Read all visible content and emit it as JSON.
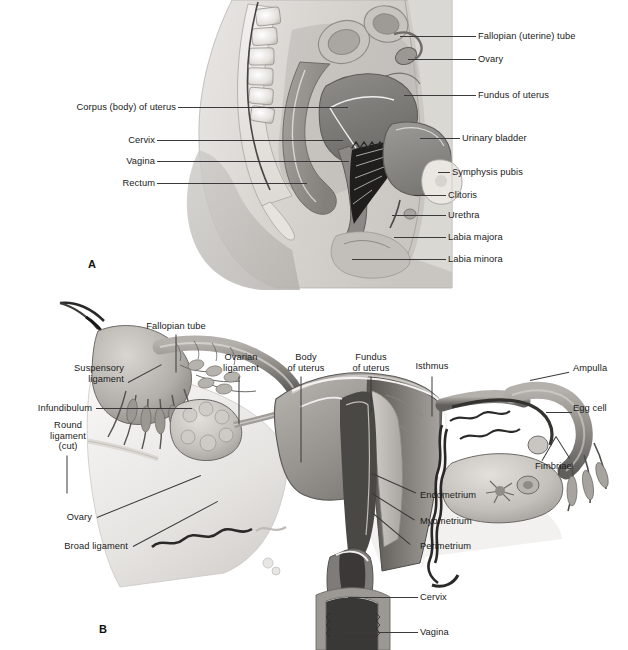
{
  "figure": {
    "background_color": "#ffffff",
    "text_color": "#1a1a1a",
    "leader_color": "#3a3a3a"
  },
  "panel_a": {
    "letter": "A",
    "caption": "Midsagittal section of female pelvis",
    "labels_right": [
      {
        "text": "Fallopian (uterine) tube",
        "x": 478,
        "y": 36
      },
      {
        "text": "Ovary",
        "x": 478,
        "y": 59
      },
      {
        "text": "Fundus of uterus",
        "x": 478,
        "y": 95
      },
      {
        "text": "Urinary bladder",
        "x": 462,
        "y": 138
      },
      {
        "text": "Symphysis pubis",
        "x": 452,
        "y": 172
      },
      {
        "text": "Clitoris",
        "x": 448,
        "y": 195
      },
      {
        "text": "Urethra",
        "x": 448,
        "y": 215
      },
      {
        "text": "Labia majora",
        "x": 448,
        "y": 237
      },
      {
        "text": "Labia minora",
        "x": 448,
        "y": 259
      }
    ],
    "labels_left": [
      {
        "text": "Corpus (body) of uterus",
        "x": 173,
        "y": 107
      },
      {
        "text": "Cervix",
        "x": 152,
        "y": 140
      },
      {
        "text": "Vagina",
        "x": 152,
        "y": 161
      },
      {
        "text": "Rectum",
        "x": 152,
        "y": 183
      }
    ]
  },
  "panel_b": {
    "letter": "B",
    "caption": "Anterior view of uterus, fallopian tubes and ovaries",
    "labels_left": [
      {
        "text": "Suspensory\nligament",
        "x": 72,
        "y": 370
      },
      {
        "text": "Infundibulum",
        "x": 92,
        "y": 404
      },
      {
        "text": "Round\nligament\n(cut)",
        "x": 80,
        "y": 427
      },
      {
        "text": "Ovary",
        "x": 92,
        "y": 513
      },
      {
        "text": "Broad ligament",
        "x": 128,
        "y": 542
      }
    ],
    "labels_top": [
      {
        "text": "Fallopian tube",
        "x": 170,
        "y": 326
      },
      {
        "text": "Ovarian\nligament",
        "x": 241,
        "y": 357
      },
      {
        "text": "Body\nof uterus",
        "x": 306,
        "y": 357
      },
      {
        "text": "Fundus\nof uterus",
        "x": 371,
        "y": 357
      },
      {
        "text": "Isthmus",
        "x": 432,
        "y": 366
      }
    ],
    "labels_right": [
      {
        "text": "Ampulla",
        "x": 573,
        "y": 368
      },
      {
        "text": "Egg cell",
        "x": 573,
        "y": 408
      },
      {
        "text": "Fimbriae",
        "x": 535,
        "y": 466
      },
      {
        "text": "Endometrium",
        "x": 420,
        "y": 495
      },
      {
        "text": "Myometrium",
        "x": 420,
        "y": 521
      },
      {
        "text": "Perimetrium",
        "x": 420,
        "y": 546
      },
      {
        "text": "Cervix",
        "x": 420,
        "y": 597
      },
      {
        "text": "Vagina",
        "x": 420,
        "y": 632
      }
    ]
  }
}
